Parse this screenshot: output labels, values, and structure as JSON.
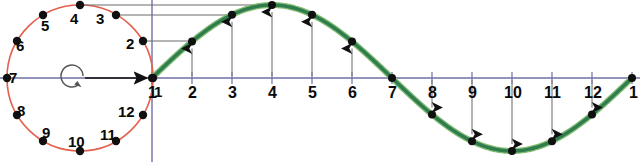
{
  "figure": {
    "type": "diagram"
  },
  "colors": {
    "circle": "#e4604e",
    "wave": "#2f7d4e",
    "wave_highlight": "#7cb86a",
    "axis": "#6f6fa8",
    "projection": "#6b6b6b",
    "marker": "#101010",
    "background": "#ffffff"
  },
  "circle": {
    "center_x": 80,
    "center_y": 78,
    "radius": 73,
    "rotation_icon": "counterclockwise-rotation-icon",
    "radius_arrow": "radius-arrow-icon",
    "points": [
      {
        "label": "1",
        "angle_deg": 0,
        "x": 153,
        "y": 78,
        "lx": 154,
        "ly": 84
      },
      {
        "label": "2",
        "angle_deg": 30,
        "x": 143,
        "y": 41,
        "lx": 126,
        "ly": 36
      },
      {
        "label": "3",
        "angle_deg": 60,
        "x": 116,
        "y": 15,
        "lx": 96,
        "ly": 11
      },
      {
        "label": "4",
        "angle_deg": 90,
        "x": 80,
        "y": 5,
        "lx": 70,
        "ly": 11
      },
      {
        "label": "5",
        "angle_deg": 120,
        "x": 43,
        "y": 15,
        "lx": 41,
        "ly": 18
      },
      {
        "label": "6",
        "angle_deg": 150,
        "x": 17,
        "y": 41,
        "lx": 16,
        "ly": 38
      },
      {
        "label": "7",
        "angle_deg": 180,
        "x": 7,
        "y": 78,
        "lx": 9,
        "ly": 70
      },
      {
        "label": "8",
        "angle_deg": 210,
        "x": 17,
        "y": 115,
        "lx": 17,
        "ly": 103
      },
      {
        "label": "9",
        "angle_deg": 240,
        "x": 43,
        "y": 141,
        "lx": 42,
        "ly": 125
      },
      {
        "label": "10",
        "angle_deg": 270,
        "x": 80,
        "y": 151,
        "lx": 68,
        "ly": 134
      },
      {
        "label": "11",
        "angle_deg": 300,
        "x": 116,
        "y": 141,
        "lx": 100,
        "ly": 127
      },
      {
        "label": "12",
        "angle_deg": 330,
        "x": 143,
        "y": 115,
        "lx": 118,
        "ly": 104
      }
    ]
  },
  "wave": {
    "axis_y": 78,
    "x_start": 152,
    "x_end": 632,
    "tick_spacing": 40,
    "amplitude": 73,
    "description": "one full sine period sampled at 12 equal phase steps"
  },
  "axis_labels": [
    {
      "label": "1",
      "x": 152,
      "value": 0
    },
    {
      "label": "2",
      "x": 192,
      "value": 0.5
    },
    {
      "label": "3",
      "x": 232,
      "value": 0.866
    },
    {
      "label": "4",
      "x": 272,
      "value": 1
    },
    {
      "label": "5",
      "x": 312,
      "value": 0.866
    },
    {
      "label": "6",
      "x": 352,
      "value": 0.5
    },
    {
      "label": "7",
      "x": 392,
      "value": 0
    },
    {
      "label": "8",
      "x": 432,
      "value": -0.5
    },
    {
      "label": "9",
      "x": 472,
      "value": -0.866
    },
    {
      "label": "10",
      "x": 512,
      "value": -1
    },
    {
      "label": "11",
      "x": 552,
      "value": -0.866
    },
    {
      "label": "12",
      "x": 592,
      "value": -0.5
    },
    {
      "label": "1",
      "x": 632,
      "value": 0
    }
  ],
  "projection_lines": [
    {
      "from_point": "2",
      "to_x": 192,
      "y": 41
    },
    {
      "from_point": "3",
      "to_x": 232,
      "y": 15
    },
    {
      "from_point": "4",
      "to_x": 272,
      "y": 5
    }
  ],
  "chart_data": {
    "type": "line",
    "title": "",
    "xlabel": "",
    "ylabel": "",
    "x": [
      1,
      2,
      3,
      4,
      5,
      6,
      7,
      8,
      9,
      10,
      11,
      12,
      13
    ],
    "categories": [
      "1",
      "2",
      "3",
      "4",
      "5",
      "6",
      "7",
      "8",
      "9",
      "10",
      "11",
      "12",
      "1"
    ],
    "values": [
      0,
      0.5,
      0.866,
      1,
      0.866,
      0.5,
      0,
      -0.5,
      -0.866,
      -1,
      -0.866,
      -0.5,
      0
    ],
    "ylim": [
      -1,
      1
    ],
    "grid": false,
    "legend": "none"
  }
}
